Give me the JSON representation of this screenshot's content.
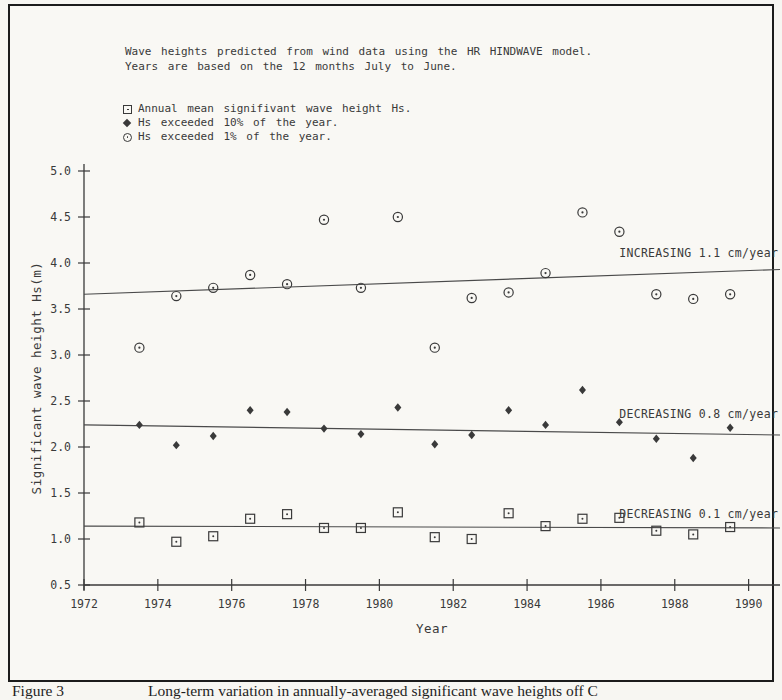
{
  "figure": {
    "header_line1": "Wave heights predicted from wind data using the HR HINDWAVE model.",
    "header_line2": "Years are based on the 12 months July to June.",
    "caption_label": "Figure 3",
    "caption_text": "Long-term variation in annually-averaged significant wave heights off C"
  },
  "legend": {
    "position": "top-left",
    "items": [
      {
        "marker": "square-dot",
        "label": "Annual mean signifivant wave height Hs."
      },
      {
        "marker": "diamond",
        "label": "Hs exceeded 10% of the year."
      },
      {
        "marker": "circle-dot",
        "label": "Hs exceeded 1% of the year."
      }
    ]
  },
  "chart_data": {
    "type": "scatter",
    "title": "",
    "xlabel": "Year",
    "ylabel": "Significant wave height Hs(m)",
    "xlim": [
      1972,
      1990.85
    ],
    "ylim": [
      0.5,
      5.0
    ],
    "grid": false,
    "x_ticks": [
      1972,
      1974,
      1976,
      1978,
      1980,
      1982,
      1984,
      1986,
      1988,
      1990
    ],
    "y_ticks": [
      0.5,
      1.0,
      1.5,
      2.0,
      2.5,
      3.0,
      3.5,
      4.0,
      4.5,
      5.0
    ],
    "x": [
      1973.5,
      1974.5,
      1975.5,
      1976.5,
      1977.5,
      1978.5,
      1979.5,
      1980.5,
      1981.5,
      1982.5,
      1983.5,
      1984.5,
      1985.5,
      1986.5,
      1987.5,
      1988.5,
      1989.5
    ],
    "series": [
      {
        "name": "Annual mean significant wave height Hs",
        "marker": "square-dot",
        "values": [
          1.18,
          0.97,
          1.03,
          1.22,
          1.27,
          1.12,
          1.12,
          1.29,
          1.02,
          1.0,
          1.28,
          1.14,
          1.22,
          1.23,
          1.09,
          1.05,
          1.13
        ]
      },
      {
        "name": "Hs exceeded 10% of the year",
        "marker": "diamond",
        "values": [
          2.24,
          2.02,
          2.12,
          2.4,
          2.38,
          2.2,
          2.14,
          2.43,
          2.03,
          2.13,
          2.4,
          2.24,
          2.62,
          2.27,
          2.09,
          1.88,
          2.21
        ]
      },
      {
        "name": "Hs exceeded 1% of the year",
        "marker": "circle-dot",
        "values": [
          3.08,
          3.64,
          3.73,
          3.87,
          3.77,
          4.47,
          3.73,
          4.5,
          3.08,
          3.62,
          3.68,
          3.89,
          4.55,
          4.34,
          3.66,
          3.61,
          3.66
        ]
      }
    ],
    "trend_lines": [
      {
        "label": "INCREASING 1.1 cm/year",
        "start": {
          "x": 1972,
          "y": 3.66
        },
        "end": {
          "x": 1990.85,
          "y": 3.93
        },
        "label_pos": {
          "x": 1990.8,
          "y": 4.07
        }
      },
      {
        "label": "DECREASING 0.8 cm/year",
        "start": {
          "x": 1972,
          "y": 2.24
        },
        "end": {
          "x": 1990.85,
          "y": 2.13
        },
        "label_pos": {
          "x": 1990.8,
          "y": 2.31
        }
      },
      {
        "label": "DECREASING 0.1 cm/year",
        "start": {
          "x": 1972,
          "y": 1.14
        },
        "end": {
          "x": 1990.85,
          "y": 1.12
        },
        "label_pos": {
          "x": 1990.8,
          "y": 1.23
        }
      }
    ]
  }
}
